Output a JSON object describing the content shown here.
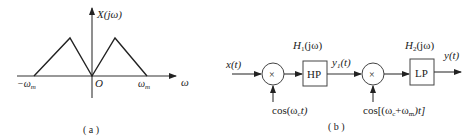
{
  "figure_a": {
    "caption": "( a )",
    "y_axis_label": "X(jω)",
    "x_axis_label": "ω",
    "origin_label": "O",
    "tick_left": "−ω",
    "tick_left_sub": "m",
    "tick_right": "ω",
    "tick_right_sub": "m",
    "spectrum_points": [
      [
        -1,
        0
      ],
      [
        -0.5,
        1
      ],
      [
        0,
        0
      ],
      [
        0.5,
        1
      ],
      [
        1,
        0
      ]
    ]
  },
  "figure_b": {
    "caption": "( b )",
    "input_label": "x(t)",
    "multiplier1_symbol": "×",
    "carrier1_label": "cos(ω",
    "carrier1_sub": "c",
    "carrier1_tail": "t)",
    "filter1": {
      "label": "HP",
      "transfer_name": "H",
      "transfer_sub": "1",
      "transfer_arg": "(jω)"
    },
    "intermediate_label": "y",
    "intermediate_sub": "1",
    "intermediate_arg": "(t)",
    "multiplier2_symbol": "×",
    "carrier2_label": "cos[(ω",
    "carrier2_sub1": "c",
    "carrier2_mid": "+ω",
    "carrier2_sub2": "m",
    "carrier2_tail": ")t]",
    "filter2": {
      "label": "LP",
      "transfer_name": "H",
      "transfer_sub": "2",
      "transfer_arg": "(jω)"
    },
    "output_label": "y(t)"
  }
}
